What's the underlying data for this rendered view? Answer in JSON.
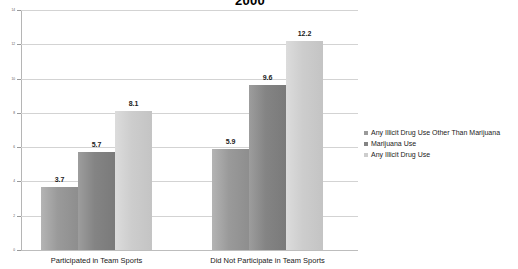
{
  "chart_data": {
    "type": "bar",
    "title": "2000",
    "xlabel": "",
    "ylabel": "",
    "categories": [
      "Participated in Team Sports",
      "Did Not Participate in Team Sports"
    ],
    "series": [
      {
        "name": "Any Illicit Drug Use Other Than Marijuana",
        "color": "#9a9a9a",
        "values": [
          3.7,
          5.9
        ]
      },
      {
        "name": "Marijuana Use",
        "color": "#848484",
        "values": [
          5.7,
          9.6
        ]
      },
      {
        "name": "Any Illicit Drug Use",
        "color": "#cdcdcd",
        "values": [
          8.1,
          12.2
        ]
      }
    ],
    "ylim": [
      0,
      14
    ],
    "yticks": [
      0,
      2,
      4,
      6,
      8,
      10,
      12,
      14
    ],
    "ytick_labels": [
      "0",
      "2",
      "4",
      "6",
      "8",
      "10",
      "12",
      "14"
    ],
    "grid": true,
    "legend_position": "right",
    "data_labels": [
      "3.7",
      "5.7",
      "8.1",
      "5.9",
      "9.6",
      "12.2"
    ]
  }
}
